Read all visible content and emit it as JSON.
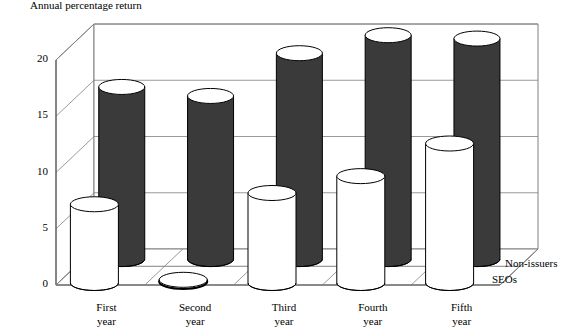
{
  "chart_data": {
    "type": "bar",
    "title": "Annual percentage return",
    "xlabel": "",
    "ylabel": "Annual percentage return",
    "categories": [
      "First year",
      "Second year",
      "Third year",
      "Fourth year",
      "Fifth year"
    ],
    "category_lines": [
      [
        "First",
        "year"
      ],
      [
        "Second",
        "year"
      ],
      [
        "Third",
        "year"
      ],
      [
        "Fourth",
        "year"
      ],
      [
        "Fifth",
        "year"
      ]
    ],
    "series": [
      {
        "name": "Non-issuers",
        "color": "#3a3a3a",
        "values": [
          15.3,
          14.5,
          18.3,
          19.9,
          19.6
        ]
      },
      {
        "name": "SEOs",
        "color": "#ffffff",
        "values": [
          7.0,
          0.0,
          8.0,
          9.5,
          12.4
        ]
      }
    ],
    "ylim": [
      0,
      20
    ],
    "yticks": [
      0,
      5,
      10,
      15,
      20
    ],
    "ytick_labels": [
      "0",
      "5",
      "10",
      "15",
      "20"
    ],
    "grid": true,
    "legend_position": "right",
    "projection": "3d-cylinder"
  },
  "axis": {
    "title": "Annual percentage return",
    "ticks": [
      {
        "label": "20",
        "value": 20
      },
      {
        "label": "15",
        "value": 15
      },
      {
        "label": "10",
        "value": 10
      },
      {
        "label": "5",
        "value": 5
      },
      {
        "label": "0",
        "value": 0
      }
    ]
  },
  "legend": {
    "back_label": "Non-issuers",
    "front_label": "SEOs"
  },
  "colors": {
    "dark_fill": "#3a3a3a",
    "light_fill": "#ffffff",
    "outline": "#000000",
    "wall": "#808080",
    "background": "#ffffff"
  }
}
